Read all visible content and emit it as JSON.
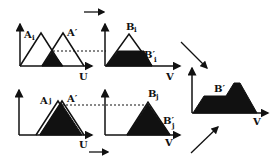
{
  "diagram": {
    "type": "fuzzy-inference-mamdani",
    "rule1": {
      "antecedent": {
        "set_label": "A",
        "set_sub": "i",
        "input_label": "A′",
        "axis_label": "U"
      },
      "consequent": {
        "set_label": "B",
        "set_sub": "i",
        "output_label": "B′",
        "output_sub": "i",
        "axis_label": "V"
      }
    },
    "rule2": {
      "antecedent": {
        "set_label": "A",
        "set_sub": "j",
        "input_label": "A′",
        "axis_label": "U"
      },
      "consequent": {
        "set_label": "B",
        "set_sub": "j",
        "output_label": "B′",
        "output_sub": "j",
        "axis_label": "V"
      }
    },
    "aggregate": {
      "output_label": "B′",
      "axis_label": "V"
    },
    "colors": {
      "ink": "#111111",
      "background": "#ffffff"
    }
  }
}
